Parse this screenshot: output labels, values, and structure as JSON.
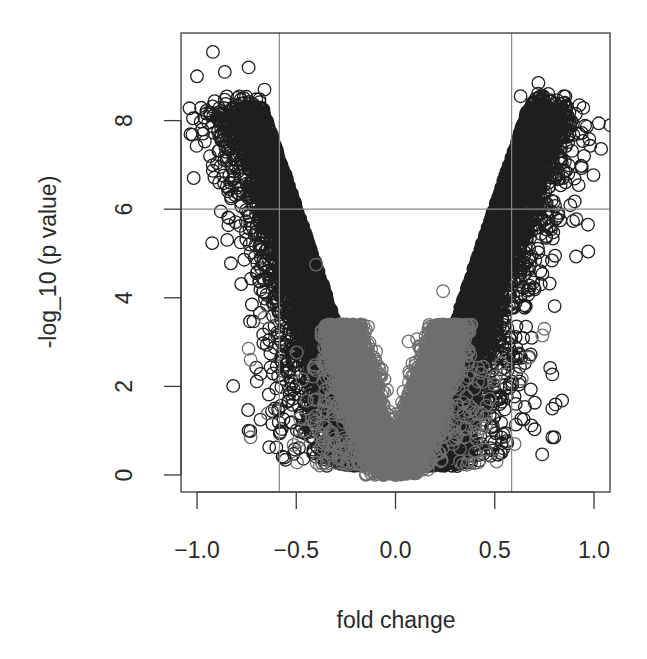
{
  "chart_data": {
    "type": "scatter",
    "subtype": "volcano",
    "title": "",
    "xlabel": "fold change",
    "ylabel": "-log_10 (p value)",
    "xlim": [
      -1.07,
      1.08
    ],
    "ylim": [
      -0.4,
      9.8
    ],
    "x_ticks": [
      -1.0,
      -0.5,
      0.0,
      0.5,
      1.0
    ],
    "x_tick_labels": [
      "−1.0",
      "−0.5",
      "0.0",
      "0.5",
      "1.0"
    ],
    "y_ticks": [
      0,
      2,
      4,
      6,
      8
    ],
    "y_tick_labels": [
      "0",
      "2",
      "4",
      "6",
      "8"
    ],
    "grid": false,
    "legend": null,
    "threshold_lines": {
      "vertical": [
        -0.585,
        0.585
      ],
      "horizontal": [
        6
      ],
      "color": "#8a8a8a"
    },
    "marker": "open-circle",
    "series": [
      {
        "name": "all genes (outer, dark)",
        "color": "#1e1e1e",
        "description": "Dense volcano-shaped cloud; -log10 p rises roughly linearly with |fold change| up to ~8.5",
        "approx_relation": "y ≈ 13.5 * |x| (dense band |x| 0.25–0.75, y 2–8.5)",
        "notable_points": [
          {
            "x": -0.92,
            "y": 9.55
          },
          {
            "x": -1.0,
            "y": 9.0
          },
          {
            "x": -0.86,
            "y": 9.1
          },
          {
            "x": -0.74,
            "y": 9.2
          },
          {
            "x": -0.66,
            "y": 8.7
          },
          {
            "x": -0.87,
            "y": 8.15
          },
          {
            "x": -0.88,
            "y": 5.95
          },
          {
            "x": -0.78,
            "y": 5.25
          },
          {
            "x": -0.57,
            "y": 2.35
          },
          {
            "x": -0.74,
            "y": 1.0
          },
          {
            "x": -0.68,
            "y": 1.25
          },
          {
            "x": -0.62,
            "y": 1.15
          },
          {
            "x": 0.72,
            "y": 8.85
          },
          {
            "x": 0.77,
            "y": 8.6
          },
          {
            "x": 0.63,
            "y": 8.55
          },
          {
            "x": 0.86,
            "y": 7.95
          },
          {
            "x": 0.95,
            "y": 7.2
          },
          {
            "x": 0.97,
            "y": 5.65
          },
          {
            "x": 0.83,
            "y": 5.75
          },
          {
            "x": 0.73,
            "y": 4.6
          },
          {
            "x": 0.79,
            "y": 1.5
          },
          {
            "x": 0.79,
            "y": 0.85
          },
          {
            "x": 0.8,
            "y": 0.85
          }
        ]
      },
      {
        "name": "non-significant (inner, gray)",
        "color": "#6e6e6e",
        "description": "Inner V of low-effect genes, |fold change| < ~0.3, -log10 p < ~4",
        "approx_relation": "y ≈ 14 * |x| (|x| 0–0.3, y 0–4)",
        "notable_points": [
          {
            "x": -0.4,
            "y": 4.75
          },
          {
            "x": 0.24,
            "y": 4.15
          },
          {
            "x": -0.74,
            "y": 2.85
          },
          {
            "x": -0.73,
            "y": 2.6
          },
          {
            "x": -0.66,
            "y": 3.55
          },
          {
            "x": 0.75,
            "y": 3.3
          },
          {
            "x": 0.74,
            "y": 3.15
          },
          {
            "x": 0.67,
            "y": 2.65
          },
          {
            "x": 0.6,
            "y": 0.7
          },
          {
            "x": -0.73,
            "y": 0.85
          },
          {
            "x": -0.25,
            "y": 0.25
          }
        ]
      }
    ],
    "generation": {
      "seed": 12345,
      "dark_count": 9000,
      "gray_count": 6000
    }
  },
  "layout": {
    "plot_box": {
      "left": 181,
      "top": 33,
      "right": 610,
      "bottom": 492
    },
    "x_map": {
      "origin_px": 395.5,
      "px_per_unit": 198.5
    },
    "y_map": {
      "origin_px": 475,
      "px_per_unit": 44.3
    },
    "circle_radius": 6.3
  }
}
